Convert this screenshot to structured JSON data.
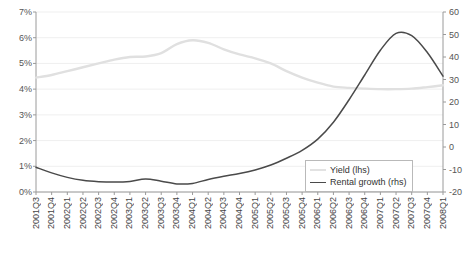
{
  "chart_data": {
    "type": "line",
    "title": "",
    "subtitle": "",
    "xlabel": "",
    "ylabel": "",
    "grid": true,
    "legend_position": "inside-bottom-right",
    "x": [
      "2001Q3",
      "2001Q4",
      "2002Q1",
      "2002Q2",
      "2002Q3",
      "2002Q4",
      "2003Q1",
      "2003Q2",
      "2003Q3",
      "2003Q4",
      "2004Q1",
      "2004Q2",
      "2004Q3",
      "2004Q4",
      "2005Q1",
      "2005Q2",
      "2005Q3",
      "2005Q4",
      "2006Q1",
      "2006Q2",
      "2006Q3",
      "2006Q4",
      "2007Q1",
      "2007Q2",
      "2007Q3",
      "2007Q4",
      "2008Q1"
    ],
    "axes": {
      "left": {
        "label": "",
        "ticks": [
          "0%",
          "1%",
          "2%",
          "3%",
          "4%",
          "5%",
          "6%",
          "7%"
        ],
        "values": [
          0,
          1,
          2,
          3,
          4,
          5,
          6,
          7
        ],
        "min": 0,
        "max": 7
      },
      "right": {
        "label": "",
        "ticks": [
          "-20",
          "-10",
          "0",
          "10",
          "20",
          "30",
          "40",
          "50",
          "60"
        ],
        "values": [
          -20,
          -10,
          0,
          10,
          20,
          30,
          40,
          50,
          60
        ],
        "min": -20,
        "max": 60
      }
    },
    "series": [
      {
        "name": "Yield (lhs)",
        "axis": "left",
        "color": "#e0e0e0",
        "values": [
          4.45,
          4.55,
          4.7,
          4.85,
          5.0,
          5.15,
          5.25,
          5.27,
          5.4,
          5.75,
          5.9,
          5.8,
          5.55,
          5.35,
          5.2,
          5.0,
          4.7,
          4.45,
          4.25,
          4.1,
          4.05,
          4.02,
          4.0,
          4.0,
          4.02,
          4.08,
          4.15
        ]
      },
      {
        "name": "Rental growth (rhs)",
        "axis": "right",
        "color": "#4a4a4a",
        "values": [
          -9.0,
          -11.5,
          -13.5,
          -14.8,
          -15.4,
          -15.6,
          -15.3,
          -14.2,
          -15.2,
          -16.4,
          -16.2,
          -14.4,
          -13.0,
          -11.8,
          -10.2,
          -8.0,
          -5.0,
          -1.5,
          3.5,
          11.0,
          21.0,
          32.0,
          43.0,
          50.5,
          49.5,
          42.0,
          31.5
        ]
      }
    ],
    "legend": [
      {
        "label": "Yield (lhs)",
        "swatch": "yield"
      },
      {
        "label": "Rental growth (rhs)",
        "swatch": "rental"
      }
    ]
  }
}
